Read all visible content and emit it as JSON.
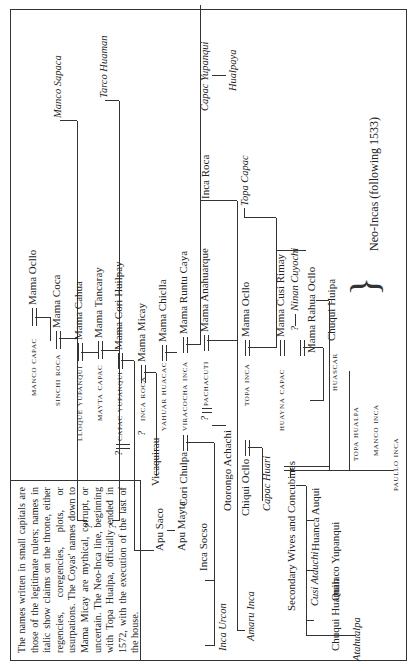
{
  "note": "The names written in small capitals are those of the legitimate rulers; names in italic show claims on the throne, either regencies, coregencies, plots, or usurpations. The Coyas' names down to Mama Micay are mythical, corrupt, or uncertain. The Neo-Inca line, beginning with Topa Hualpa, officially ended in 1572, with the execution of the last of the house.",
  "rulers": {
    "manco_capac": "Manco Capac",
    "sinchi_roca": "Sinchi Roca",
    "lloque_yupanqui": "Lloque Yupanqui",
    "mayta_capac": "Mayta Capac",
    "capac_yupanqui": "Capac Yupanqui",
    "inca_roca": "Inca Roca",
    "yahuar_huacac": "Yahuar Huacac",
    "viracocha_inca": "Viracocha Inca",
    "pachacuti": "Pachacuti",
    "topa_inca": "Topa Inca",
    "huayna_capac": "Huayna Capac",
    "huascar": "Huascar",
    "topa_hualpa": "Topa Hualpa",
    "manco_inca": "Manco Inca",
    "paullo_inca": "Paullo Inca"
  },
  "coyas": {
    "mama_ocllo": "Mama Ocllo",
    "mama_coca": "Mama Coca",
    "mama_cahua": "Mama Cahua",
    "mama_tancaray": "Mama Tancaray",
    "mama_cori_huilpay": "Mama Cori Huilpay",
    "mama_micay": "Mama Micay",
    "mama_chiclla": "Mama Chiclla",
    "mama_runtu_caya": "Mama Runtu Caya",
    "mama_anahuarque": "Mama Anahuarque",
    "mama_ocllo_2": "Mama Ocllo",
    "mama_cusi_rimay": "Mama Cusi Rimay",
    "mama_rahua_ocllo": "Mama Rahua Ocllo"
  },
  "claimants": {
    "manco_sapaca": "Manco Sapaca",
    "tarco_huaman": "Tarco Huaman",
    "capac_yupanqui_2": "Capac Yupanqui",
    "hualpaya": "Hualpaya",
    "topa_capac": "Topa Capac",
    "ninan_cuyochi": "Ninan Cuyochi",
    "inca_urcon": "Inca Urcon",
    "amaru_inca": "Amaru Inca",
    "capac_huari": "Capac Huari",
    "atahualpa": "Atahualpa",
    "cusi_atauchi": "Cusi Atauchi"
  },
  "others": {
    "inca_roca_2": "Inca Roca",
    "apu_saco": "Apu Saco",
    "apu_mayta": "Apu Mayta",
    "vicaquirau": "Vicaquirau",
    "cori_chulpa": "Cori Chulpa",
    "inca_socso": "Inca Socso",
    "otorongo_achachi": "Otorongo Achachi",
    "chiqui_ocllo": "Chiqui Ocllo",
    "secondary_wives": "Secondary Wives and Concubines",
    "huanca_auqui": "Huanca Auqui",
    "quilaco_yupanqui": "Quilaco Yupanqui",
    "chuqui_huaman": "Chuqui Huaman",
    "chuqui_huipa": "Chuqui Huipa"
  },
  "neo_incas": "Neo-Incas (following 1533)",
  "uncertain_mark": "?"
}
